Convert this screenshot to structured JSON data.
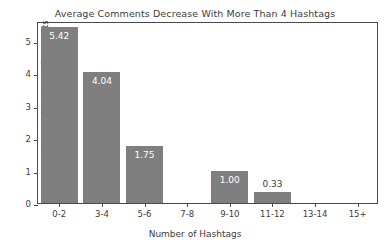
{
  "chart_data": {
    "type": "bar",
    "title": "Average Comments Decrease With More Than 4 Hashtags",
    "xlabel": "Number of Hashtags",
    "ylabel": "Average Number of Comments",
    "categories": [
      "0-2",
      "3-4",
      "5-6",
      "7-8",
      "9-10",
      "11-12",
      "13-14",
      "15+"
    ],
    "values": [
      5.42,
      4.04,
      1.75,
      0,
      1.0,
      0.33,
      0,
      0
    ],
    "value_labels": [
      "5.42",
      "4.04",
      "1.75",
      "",
      "1.00",
      "0.33",
      "",
      ""
    ],
    "ylim": [
      0,
      5.6
    ],
    "yticks": [
      0,
      1,
      2,
      3,
      4,
      5
    ],
    "ytick_labels": [
      "0",
      "1",
      "2",
      "3",
      "4",
      "5"
    ],
    "grid": false,
    "legend": "none",
    "bar_color": "#7f7f7f",
    "label_color_inside": "#ffffff",
    "label_color_outside": "#3a3a3a",
    "axis_color": "#4a4a4a",
    "background": "#ffffff"
  }
}
